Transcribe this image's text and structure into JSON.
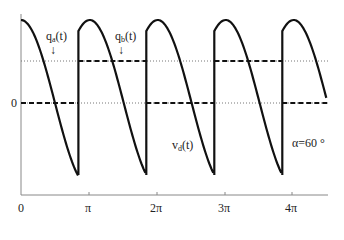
{
  "chart_data": {
    "type": "line",
    "title": "",
    "xlabel": "",
    "ylabel": "",
    "x_tick_labels": [
      "0",
      "π",
      "2π",
      "3π",
      "4π"
    ],
    "x_ticks": [
      0,
      3.1416,
      6.2832,
      9.4248,
      12.5664
    ],
    "xlim": [
      0,
      14.3
    ],
    "y_tick_labels": [
      "0"
    ],
    "grid": false,
    "annotations": {
      "qa": "q",
      "qa_sub": "a",
      "qb": "q",
      "qb_sub": "b",
      "arg": "(t)",
      "arrow": "↓",
      "vd": "v",
      "vd_sub": "d",
      "alpha": "α=60 °"
    },
    "alpha_deg": 60,
    "series": [
      {
        "name": "v_d(t)",
        "style": "solid",
        "description": "phase-controlled rectifier output, cosine segments from +0.866 to -0.866 of peak each π interval, first segment starts at peak",
        "amplitude_norm": 1.0,
        "segment_phase_start_deg": -30,
        "segment_phase_end_deg": 150,
        "jumps_at_x": [
          2.65,
          5.79,
          8.93,
          12.07
        ]
      },
      {
        "name": "q_a(t)",
        "style": "dashed",
        "levels": [
          {
            "x": [
              0,
              2.65
            ],
            "y": 0
          },
          {
            "x": [
              2.65,
              5.79
            ],
            "y": 0.5
          },
          {
            "x": [
              5.79,
              8.93
            ],
            "y": 0
          },
          {
            "x": [
              8.93,
              12.07
            ],
            "y": 0.5
          },
          {
            "x": [
              12.07,
              14.3
            ],
            "y": 0
          }
        ]
      },
      {
        "name": "upper reference",
        "style": "dotted",
        "y": 0.5
      },
      {
        "name": "zero reference",
        "style": "dotted",
        "y": 0
      }
    ]
  },
  "labels": {
    "zero": "0",
    "pi": "π",
    "two_pi": "2π",
    "three_pi": "3π",
    "four_pi": "4π"
  }
}
